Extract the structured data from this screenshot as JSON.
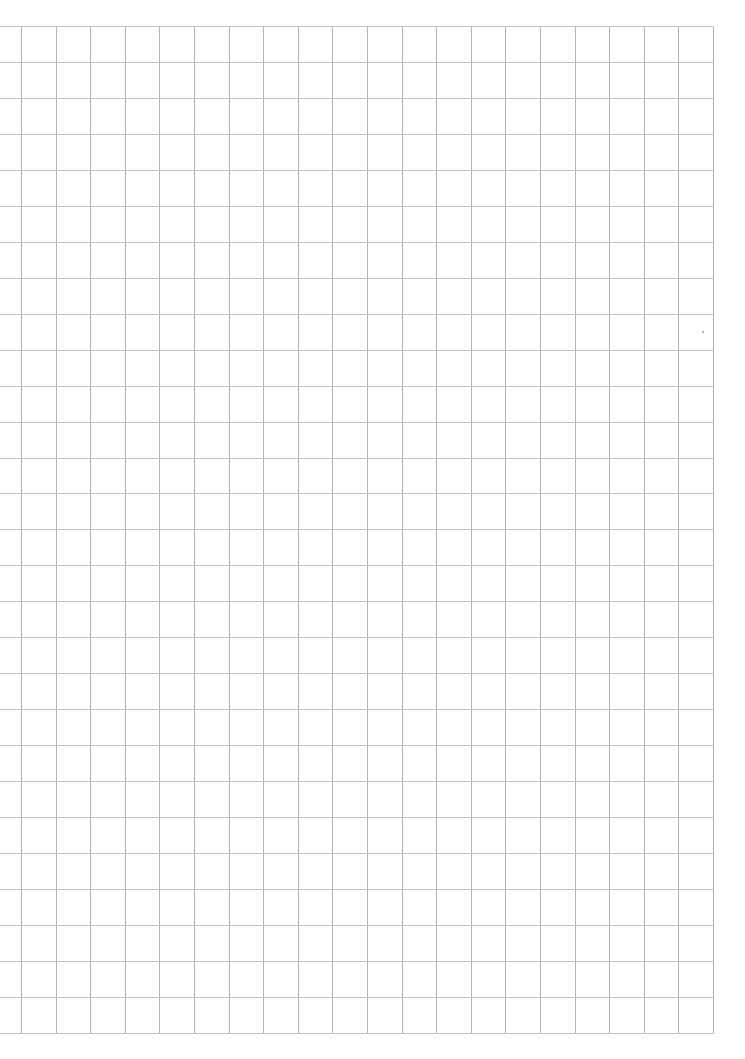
{
  "sheet": {
    "type": "grid-paper",
    "background_color": "#ffffff",
    "line_color_vertical": "#b4b4b4",
    "line_color_horizontal": "#c4c4c4"
  },
  "grid": {
    "origin_x": 21,
    "origin_y": 26,
    "columns": 20,
    "rows": 28,
    "cell_width": 34.6,
    "cell_height": 35.96,
    "horizontal_line_start_x": 0,
    "horizontal_line_end_x": 713,
    "vertical_line_start_y": 26,
    "vertical_line_end_y": 1033
  },
  "marks": [
    {
      "name": "speck",
      "x": 702,
      "y": 331
    }
  ]
}
